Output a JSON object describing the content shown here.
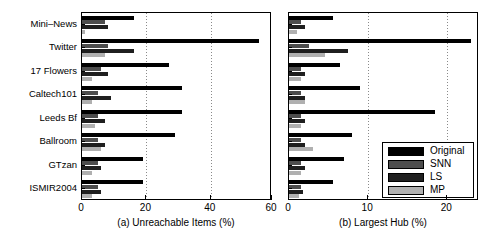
{
  "chart_data": {
    "type": "bar",
    "orientation": "horizontal",
    "title": "",
    "categories": [
      "Mini–News",
      "Twitter",
      "17 Flowers",
      "Caltech101",
      "Leeds Bf",
      "Ballroom",
      "GTzan",
      "ISMIR2004"
    ],
    "legend": {
      "position": "inside-right-lower",
      "entries": [
        {
          "name": "Original",
          "color": "#000000"
        },
        {
          "name": "SNN",
          "color": "#4d4d4d"
        },
        {
          "name": "LS",
          "color": "#1f1f1f"
        },
        {
          "name": "MP",
          "color": "#b0b0b0"
        }
      ]
    },
    "panels": [
      {
        "id": "a",
        "xlabel": "(a) Unreachable Items (%)",
        "ylabel": "",
        "xlim": [
          0,
          59
        ],
        "xticks": [
          0,
          20,
          40,
          60
        ],
        "xticklabels": [
          "0",
          "20",
          "40",
          "60"
        ],
        "grid": true,
        "series": [
          {
            "name": "Original",
            "values": [
              16,
              55,
              27,
              31,
              31,
              29,
              19,
              19
            ]
          },
          {
            "name": "SNN",
            "values": [
              7,
              8,
              6,
              5,
              5,
              5,
              5,
              5
            ]
          },
          {
            "name": "LS",
            "values": [
              8,
              16,
              8,
              9,
              7,
              7,
              6,
              6
            ]
          },
          {
            "name": "MP",
            "values": [
              1,
              7,
              3,
              3,
              4,
              6,
              3,
              3
            ]
          }
        ]
      },
      {
        "id": "b",
        "xlabel": "(b) Largest Hub (%)",
        "ylabel": "",
        "xlim": [
          0,
          24
        ],
        "xticks": [
          0,
          10,
          20
        ],
        "xticklabels": [
          "0",
          "10",
          "20"
        ],
        "grid": true,
        "series": [
          {
            "name": "Original",
            "values": [
              5.5,
              23.0,
              6.5,
              9.0,
              18.5,
              8.0,
              7.0,
              5.5
            ]
          },
          {
            "name": "SNN",
            "values": [
              1.5,
              2.5,
              1.5,
              1.5,
              1.5,
              1.5,
              1.5,
              1.5
            ]
          },
          {
            "name": "LS",
            "values": [
              2.0,
              7.5,
              2.0,
              2.0,
              2.0,
              2.0,
              2.0,
              1.8
            ]
          },
          {
            "name": "MP",
            "values": [
              1.0,
              4.5,
              1.5,
              2.0,
              1.5,
              3.0,
              1.5,
              1.2
            ]
          }
        ]
      }
    ]
  }
}
